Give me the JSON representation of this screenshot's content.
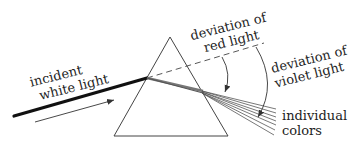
{
  "diagram": {
    "labels": {
      "incident_line1": "incident",
      "incident_line2": "white light",
      "red_line1": "deviation of",
      "red_line2": "red light",
      "violet_line1": "deviation of",
      "violet_line2": "violet light",
      "colors_line1": "individual",
      "colors_line2": "colors"
    },
    "colors": {
      "line": "#333333",
      "incident_ray": "#111111",
      "refracted": "#555555",
      "background": "#ffffff"
    },
    "elements": [
      "prism-triangle",
      "incident-ray",
      "direction-arrow",
      "undeviated-dashed-line",
      "refracted-beam",
      "dispersed-rays",
      "red-deviation-arc",
      "violet-deviation-arc"
    ]
  }
}
